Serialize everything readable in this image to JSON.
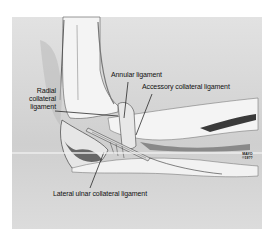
{
  "figure": {
    "labels": [
      {
        "id": "radial-collateral",
        "lines": [
          "Radial",
          "collateral",
          "ligament"
        ]
      },
      {
        "id": "annular",
        "text": "Annular ligament"
      },
      {
        "id": "accessory-collateral",
        "text": "Accessory collateral ligament"
      },
      {
        "id": "lateral-ulnar-collateral",
        "text": "Lateral ulnar collateral ligament"
      }
    ],
    "copyright": {
      "line1": "MAYO",
      "line2": "©19??"
    },
    "colors": {
      "background": "#d6d6d6",
      "bone": "#f2f2f2",
      "shadow": "#3a3a3a",
      "text": "#111111"
    }
  }
}
